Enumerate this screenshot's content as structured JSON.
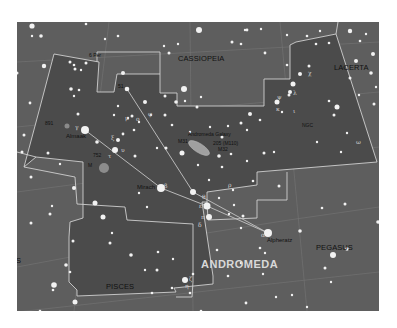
{
  "map": {
    "title": "ANDROMEDA",
    "background_color": "#5e5e5e",
    "constellation_fill": "#4a4a4a",
    "boundary_color": "#c8c8c8",
    "grid_color": "#7a7a7a",
    "figure_line_color": "#bdbdbd",
    "neighbor_constellations": [
      {
        "name": "CASSIOPEIA",
        "x": 178,
        "y": 38
      },
      {
        "name": "LACERTA",
        "x": 334,
        "y": 46
      },
      {
        "name": "PEGASUS",
        "x": 316,
        "y": 226
      },
      {
        "name": "PISCES",
        "x": 106,
        "y": 265
      },
      {
        "name": "S",
        "x": -1,
        "y": 239
      }
    ],
    "star_names": [
      {
        "name": "Almaak",
        "x": 49,
        "y": 115
      },
      {
        "name": "Mirach",
        "x": 120,
        "y": 166
      },
      {
        "name": "Alpheratz",
        "x": 249,
        "y": 218
      }
    ],
    "object_labels": [
      {
        "name": "Andromeda Galaxy",
        "x": 170,
        "y": 113
      },
      {
        "name": "M31",
        "x": 161,
        "y": 120
      },
      {
        "name": "205 (M110)",
        "x": 196,
        "y": 122
      },
      {
        "name": "M32",
        "x": 200,
        "y": 128
      },
      {
        "name": "891",
        "x": 27,
        "y": 101
      },
      {
        "name": "752",
        "x": 76,
        "y": 134
      },
      {
        "name": "M",
        "x": 71,
        "y": 141
      },
      {
        "name": "51",
        "x": 101,
        "y": 64
      },
      {
        "name": "6 Per",
        "x": 72,
        "y": 34
      },
      {
        "name": "NGC",
        "x": 289,
        "y": 104
      }
    ],
    "greek_letters": [
      {
        "g": "γ",
        "x": 58,
        "y": 106
      },
      {
        "g": "φ",
        "x": 131,
        "y": 93
      },
      {
        "g": "ο",
        "x": 119,
        "y": 98
      },
      {
        "g": "υ",
        "x": 112,
        "y": 131
      },
      {
        "g": "τ",
        "x": 100,
        "y": 136
      },
      {
        "g": "ξ",
        "x": 101,
        "y": 117
      },
      {
        "g": "μ",
        "x": 152,
        "y": 174
      },
      {
        "g": "ν",
        "x": 111,
        "y": 118
      },
      {
        "g": "β",
        "x": 152,
        "y": 165
      },
      {
        "g": "δ",
        "x": 184,
        "y": 204
      },
      {
        "g": "π",
        "x": 184,
        "y": 214
      },
      {
        "g": "ε",
        "x": 190,
        "y": 190
      },
      {
        "g": "α",
        "x": 243,
        "y": 214
      },
      {
        "g": "ζ",
        "x": 186,
        "y": 257
      },
      {
        "g": "η",
        "x": 173,
        "y": 262
      },
      {
        "g": "θ",
        "x": 209,
        "y": 154
      },
      {
        "g": "ρ",
        "x": 210,
        "y": 162
      },
      {
        "g": "λ",
        "x": 276,
        "y": 72
      },
      {
        "g": "κ",
        "x": 270,
        "y": 91
      },
      {
        "g": "ι",
        "x": 277,
        "y": 98
      },
      {
        "g": "ψ",
        "x": 277,
        "y": 83
      },
      {
        "g": "ω",
        "x": 338,
        "y": 121
      },
      {
        "g": "χ",
        "x": 291,
        "y": 52
      }
    ]
  }
}
